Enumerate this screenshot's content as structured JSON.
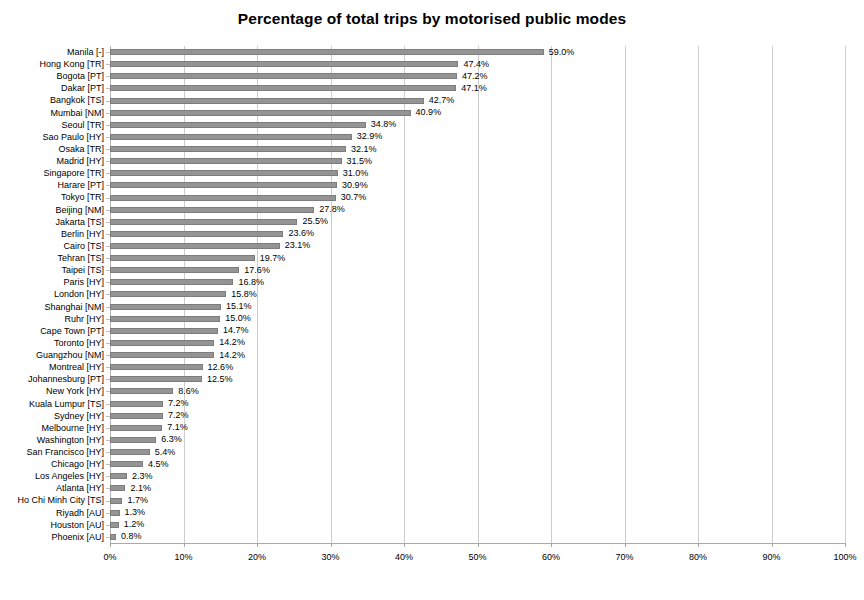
{
  "chart_data": {
    "type": "bar",
    "orientation": "horizontal",
    "title": "Percentage of total trips by motorised public modes",
    "xlabel": "",
    "ylabel": "",
    "xlim": [
      0,
      100
    ],
    "xtick_labels": [
      "0%",
      "10%",
      "20%",
      "30%",
      "40%",
      "50%",
      "60%",
      "70%",
      "80%",
      "90%",
      "100%"
    ],
    "xtick_values": [
      0,
      10,
      20,
      30,
      40,
      50,
      60,
      70,
      80,
      90,
      100
    ],
    "grid": true,
    "legend": false,
    "bar_color": "#949494",
    "bar_border_color": "#7d7d7d",
    "gridline_color": "#cccccc",
    "value_label_suffix": "%",
    "categories": [
      "Manila [-]",
      "Hong Kong [TR]",
      "Bogota [PT]",
      "Dakar [PT]",
      "Bangkok [TS]",
      "Mumbai [NM]",
      "Seoul [TR]",
      "Sao Paulo [HY]",
      "Osaka [TR]",
      "Madrid [HY]",
      "Singapore [TR]",
      "Harare [PT]",
      "Tokyo [TR]",
      "Beijing [NM]",
      "Jakarta [TS]",
      "Berlin [HY]",
      "Cairo [TS]",
      "Tehran [TS]",
      "Taipei [TS]",
      "Paris [HY]",
      "London [HY]",
      "Shanghai [NM]",
      "Ruhr [HY]",
      "Cape Town [PT]",
      "Toronto [HY]",
      "Guangzhou [NM]",
      "Montreal [HY]",
      "Johannesburg [PT]",
      "New York [HY]",
      "Kuala Lumpur [TS]",
      "Sydney [HY]",
      "Melbourne [HY]",
      "Washington [HY]",
      "San Francisco [HY]",
      "Chicago [HY]",
      "Los Angeles [HY]",
      "Atlanta [HY]",
      "Ho Chi Minh City [TS]",
      "Riyadh [AU]",
      "Houston [AU]",
      "Phoenix [AU]"
    ],
    "values": [
      59.0,
      47.4,
      47.2,
      47.1,
      42.7,
      40.9,
      34.8,
      32.9,
      32.1,
      31.5,
      31.0,
      30.9,
      30.7,
      27.8,
      25.5,
      23.6,
      23.1,
      19.7,
      17.6,
      16.8,
      15.8,
      15.1,
      15.0,
      14.7,
      14.2,
      14.2,
      12.6,
      12.5,
      8.6,
      7.2,
      7.2,
      7.1,
      6.3,
      5.4,
      4.5,
      2.3,
      2.1,
      1.7,
      1.3,
      1.2,
      0.8
    ],
    "value_labels": [
      "59.0%",
      "47.4%",
      "47.2%",
      "47.1%",
      "42.7%",
      "40.9%",
      "34.8%",
      "32.9%",
      "32.1%",
      "31.5%",
      "31.0%",
      "30.9%",
      "30.7%",
      "27.8%",
      "25.5%",
      "23.6%",
      "23.1%",
      "19.7%",
      "17.6%",
      "16.8%",
      "15.8%",
      "15.1%",
      "15.0%",
      "14.7%",
      "14.2%",
      "14.2%",
      "12.6%",
      "12.5%",
      "8.6%",
      "7.2%",
      "7.2%",
      "7.1%",
      "6.3%",
      "5.4%",
      "4.5%",
      "2.3%",
      "2.1%",
      "1.7%",
      "1.3%",
      "1.2%",
      "0.8%"
    ]
  }
}
